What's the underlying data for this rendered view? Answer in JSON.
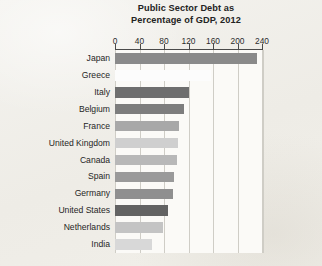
{
  "chart_data": {
    "type": "bar",
    "orientation": "horizontal",
    "title": "Public Sector Debt as Percentage of GDP, 2012",
    "title_lines": [
      "Public Sector Debt as",
      "Percentage of GDP, 2012"
    ],
    "xlabel": "",
    "ylabel": "",
    "xlim": [
      0,
      240
    ],
    "xticks": [
      0,
      40,
      80,
      120,
      160,
      200,
      240
    ],
    "xtick_labels": [
      "0",
      "40",
      "80",
      "120",
      "160",
      "200",
      "240"
    ],
    "grid": true,
    "legend": false,
    "categories": [
      "Japan",
      "Greece",
      "Italy",
      "Belgium",
      "France",
      "United Kingdom",
      "Canada",
      "Spain",
      "Germany",
      "United States",
      "Netherlands",
      "India"
    ],
    "values": [
      232,
      157,
      120,
      113,
      105,
      103,
      101,
      97,
      95,
      87,
      79,
      61
    ],
    "bar_colors": [
      "#8a8a8a",
      "#fcfcfc",
      "#6e6e6e",
      "#7d7d7d",
      "#a8a8a8",
      "#cfcfcf",
      "#b8b8b8",
      "#9a9a9a",
      "#8f8f8f",
      "#636363",
      "#c4c4c4",
      "#d8d8d8"
    ]
  },
  "colors": {
    "page_background": "#f1efe9",
    "plot_background": "#fbfaf7",
    "axis": "#4a4a4a",
    "gridline": "#cfcdc6",
    "text": "#232323"
  }
}
